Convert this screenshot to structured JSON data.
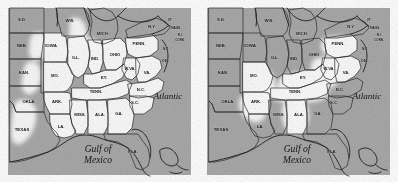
{
  "figure": {
    "background_color": "#ffffff",
    "panel_count": 2,
    "panel_width": 199,
    "panel_height": 182
  },
  "style": {
    "land_shaded_color": "#a9a9a9",
    "land_unshaded_color": "#fbfbfb",
    "ocean_color": "#a9a9a9",
    "border_color": "#2b2b2b",
    "coast_color": "#1f1f1f",
    "label_color": "#1a1a1a"
  },
  "panels": [
    {
      "id": "map-left",
      "name": "left-map",
      "ocean_labels": [
        {
          "text": "Atlantic",
          "x": 168,
          "y": 99,
          "size": 9
        },
        {
          "text": "Gulf of",
          "x": 98,
          "y": 152,
          "size": 9.5
        },
        {
          "text": "Mexico",
          "x": 98,
          "y": 163,
          "size": 9.5
        }
      ],
      "states": [
        {
          "code": "S.D.",
          "label": "S.D.",
          "x": 22,
          "y": 21,
          "size": 4.2,
          "shaded": true
        },
        {
          "code": "NEB.",
          "label": "NEB.",
          "x": 22,
          "y": 47,
          "size": 4.2,
          "shaded": true
        },
        {
          "code": "KAN.",
          "label": "KAN.",
          "x": 24,
          "y": 74,
          "size": 4.2,
          "shaded": true
        },
        {
          "code": "OKLA.",
          "label": "OKLA.",
          "x": 29,
          "y": 103,
          "size": 4.2,
          "shaded": true
        },
        {
          "code": "TEXAS",
          "label": "TEXAS",
          "x": 22,
          "y": 131,
          "size": 4.4,
          "shaded": true
        },
        {
          "code": "WIS.",
          "label": "WIS.",
          "x": 70,
          "y": 22,
          "size": 4.2,
          "shaded": true
        },
        {
          "code": "IOWA",
          "label": "IOWA",
          "x": 51,
          "y": 47,
          "size": 4.4,
          "shaded": false
        },
        {
          "code": "MO.",
          "label": "MO.",
          "x": 55,
          "y": 77,
          "size": 4.2,
          "shaded": false
        },
        {
          "code": "ARK.",
          "label": "ARK.",
          "x": 57,
          "y": 103,
          "size": 4.2,
          "shaded": false
        },
        {
          "code": "LA.",
          "label": "LA.",
          "x": 61,
          "y": 128,
          "size": 4.2,
          "shaded": false
        },
        {
          "code": "MICH.",
          "label": "MICH.",
          "x": 103,
          "y": 35,
          "size": 4.2,
          "shaded": true
        },
        {
          "code": "ILL.",
          "label": "ILL.",
          "x": 76,
          "y": 59,
          "size": 4.2,
          "shaded": false
        },
        {
          "code": "IND.",
          "label": "IND.",
          "x": 95,
          "y": 60,
          "size": 4.2,
          "shaded": false
        },
        {
          "code": "OHIO",
          "label": "OHIO",
          "x": 115,
          "y": 56,
          "size": 4.2,
          "shaded": false
        },
        {
          "code": "KY.",
          "label": "KY.",
          "x": 104,
          "y": 79,
          "size": 4.2,
          "shaded": false
        },
        {
          "code": "TENN.",
          "label": "TENN.",
          "x": 96,
          "y": 93,
          "size": 4.2,
          "shaded": false
        },
        {
          "code": "MISS.",
          "label": "MISS.",
          "x": 80,
          "y": 116,
          "size": 4.2,
          "shaded": false
        },
        {
          "code": "ALA.",
          "label": "ALA.",
          "x": 100,
          "y": 116,
          "size": 4.2,
          "shaded": false
        },
        {
          "code": "GA.",
          "label": "GA.",
          "x": 119,
          "y": 115,
          "size": 4.2,
          "shaded": false
        },
        {
          "code": "FLA.",
          "label": "FLA.",
          "x": 133,
          "y": 153,
          "size": 4.2,
          "shaded": true
        },
        {
          "code": "PENN.",
          "label": "PENN.",
          "x": 139,
          "y": 45,
          "size": 4.2,
          "shaded": false
        },
        {
          "code": "W.VA.",
          "label": "W.VA.",
          "x": 130,
          "y": 70,
          "size": 4.0,
          "shaded": false
        },
        {
          "code": "VA.",
          "label": "VA.",
          "x": 147,
          "y": 74,
          "size": 4.2,
          "shaded": false
        },
        {
          "code": "N.C.",
          "label": "N.C.",
          "x": 141,
          "y": 91,
          "size": 4.2,
          "shaded": false
        },
        {
          "code": "S.C.",
          "label": "S.C.",
          "x": 135,
          "y": 104,
          "size": 4.2,
          "shaded": false
        },
        {
          "code": "N.Y.",
          "label": "N.Y.",
          "x": 152,
          "y": 28,
          "size": 4.2,
          "shaded": true
        },
        {
          "code": "VT.",
          "label": "VT.",
          "x": 170,
          "y": 21,
          "size": 3.2,
          "shaded": true
        },
        {
          "code": "MASS.",
          "label": "MASS.",
          "x": 176,
          "y": 29,
          "size": 3.2,
          "shaded": true
        },
        {
          "code": "R.I.",
          "label": "R.I.",
          "x": 180,
          "y": 36,
          "size": 3.0,
          "shaded": true
        },
        {
          "code": "CONN.",
          "label": "CONN.",
          "x": 180,
          "y": 41,
          "size": 3.0,
          "shaded": true
        },
        {
          "code": "N.J.",
          "label": "N.J.",
          "x": 166,
          "y": 50,
          "size": 3.2,
          "shaded": true
        },
        {
          "code": "DEL.",
          "label": "DEL.",
          "x": 166,
          "y": 62,
          "size": 3.2,
          "shaded": true
        }
      ]
    },
    {
      "id": "map-right",
      "name": "right-map",
      "ocean_labels": [
        {
          "text": "Atlantic",
          "x": 168,
          "y": 99,
          "size": 9
        },
        {
          "text": "Gulf of",
          "x": 98,
          "y": 152,
          "size": 9.5
        },
        {
          "text": "Mexico",
          "x": 98,
          "y": 163,
          "size": 9.5
        }
      ],
      "states": [
        {
          "code": "S.D.",
          "label": "S.D.",
          "x": 22,
          "y": 21,
          "size": 4.2,
          "shaded": true
        },
        {
          "code": "NEB.",
          "label": "NEB.",
          "x": 22,
          "y": 47,
          "size": 4.2,
          "shaded": true
        },
        {
          "code": "KAN.",
          "label": "KAN.",
          "x": 24,
          "y": 74,
          "size": 4.2,
          "shaded": true
        },
        {
          "code": "OKLA.",
          "label": "OKLA.",
          "x": 29,
          "y": 103,
          "size": 4.2,
          "shaded": true
        },
        {
          "code": "TEXAS",
          "label": "TEXAS",
          "x": 22,
          "y": 131,
          "size": 4.4,
          "shaded": true
        },
        {
          "code": "WIS.",
          "label": "WIS.",
          "x": 70,
          "y": 22,
          "size": 4.2,
          "shaded": true
        },
        {
          "code": "IOWA",
          "label": "IOWA",
          "x": 51,
          "y": 47,
          "size": 4.4,
          "shaded": true
        },
        {
          "code": "MO.",
          "label": "MO.",
          "x": 55,
          "y": 77,
          "size": 4.2,
          "shaded": false
        },
        {
          "code": "ARK.",
          "label": "ARK.",
          "x": 57,
          "y": 103,
          "size": 4.2,
          "shaded": false
        },
        {
          "code": "LA.",
          "label": "LA.",
          "x": 61,
          "y": 128,
          "size": 4.2,
          "shaded": true
        },
        {
          "code": "MICH.",
          "label": "MICH.",
          "x": 103,
          "y": 35,
          "size": 4.2,
          "shaded": true
        },
        {
          "code": "ILL.",
          "label": "ILL.",
          "x": 76,
          "y": 59,
          "size": 4.2,
          "shaded": true
        },
        {
          "code": "IND.",
          "label": "IND.",
          "x": 95,
          "y": 60,
          "size": 4.2,
          "shaded": true
        },
        {
          "code": "OHIO",
          "label": "OHIO",
          "x": 115,
          "y": 56,
          "size": 4.2,
          "shaded": true
        },
        {
          "code": "KY.",
          "label": "KY.",
          "x": 104,
          "y": 79,
          "size": 4.2,
          "shaded": false
        },
        {
          "code": "TENN.",
          "label": "TENN.",
          "x": 96,
          "y": 93,
          "size": 4.2,
          "shaded": false
        },
        {
          "code": "MISS.",
          "label": "MISS.",
          "x": 80,
          "y": 116,
          "size": 4.2,
          "shaded": true
        },
        {
          "code": "ALA.",
          "label": "ALA.",
          "x": 100,
          "y": 116,
          "size": 4.2,
          "shaded": false
        },
        {
          "code": "GA.",
          "label": "GA.",
          "x": 119,
          "y": 115,
          "size": 4.2,
          "shaded": true
        },
        {
          "code": "FLA.",
          "label": "FLA.",
          "x": 133,
          "y": 153,
          "size": 4.2,
          "shaded": true
        },
        {
          "code": "PENN.",
          "label": "PENN.",
          "x": 139,
          "y": 45,
          "size": 4.2,
          "shaded": false
        },
        {
          "code": "W.VA.",
          "label": "W.VA.",
          "x": 130,
          "y": 70,
          "size": 4.0,
          "shaded": false
        },
        {
          "code": "VA.",
          "label": "VA.",
          "x": 147,
          "y": 74,
          "size": 4.2,
          "shaded": false
        },
        {
          "code": "N.C.",
          "label": "N.C.",
          "x": 141,
          "y": 91,
          "size": 4.2,
          "shaded": true
        },
        {
          "code": "S.C.",
          "label": "S.C.",
          "x": 135,
          "y": 104,
          "size": 4.2,
          "shaded": true
        },
        {
          "code": "N.Y.",
          "label": "N.Y.",
          "x": 152,
          "y": 28,
          "size": 4.2,
          "shaded": true
        },
        {
          "code": "VT.",
          "label": "VT.",
          "x": 170,
          "y": 21,
          "size": 3.2,
          "shaded": true
        },
        {
          "code": "MASS.",
          "label": "MASS.",
          "x": 176,
          "y": 29,
          "size": 3.2,
          "shaded": true
        },
        {
          "code": "R.I.",
          "label": "R.I.",
          "x": 180,
          "y": 36,
          "size": 3.0,
          "shaded": true
        },
        {
          "code": "CONN.",
          "label": "CONN.",
          "x": 180,
          "y": 41,
          "size": 3.0,
          "shaded": true
        },
        {
          "code": "N.J.",
          "label": "N.J.",
          "x": 166,
          "y": 50,
          "size": 3.2,
          "shaded": true
        },
        {
          "code": "DEL.",
          "label": "DEL.",
          "x": 166,
          "y": 62,
          "size": 3.2,
          "shaded": true
        }
      ]
    }
  ]
}
